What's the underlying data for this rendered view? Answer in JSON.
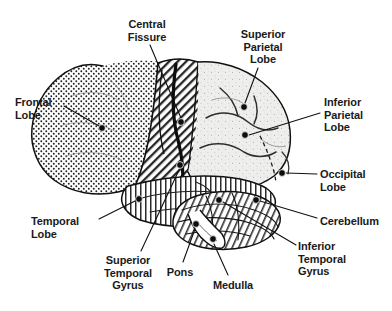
{
  "figure": {
    "background_color": "#ffffff",
    "ink_color": "#1a1a1a",
    "width": 392,
    "height": 311
  },
  "labels": [
    {
      "id": "central-fissure",
      "lines": [
        "Central",
        "Fissure"
      ],
      "align": "center",
      "x": 147,
      "y": 18,
      "marker": {
        "x": 181,
        "y": 122
      },
      "leader": [
        [
          150,
          45
        ],
        [
          181,
          118
        ]
      ]
    },
    {
      "id": "superior-parietal-lobe",
      "lines": [
        "Superior",
        "Parietal",
        "Lobe"
      ],
      "align": "center",
      "x": 263,
      "y": 28,
      "marker": {
        "x": 244,
        "y": 107
      },
      "leader": [
        [
          258,
          68
        ],
        [
          245,
          103
        ]
      ]
    },
    {
      "id": "frontal-lobe",
      "lines": [
        "Frontal",
        "Lobe"
      ],
      "align": "left",
      "x": 15,
      "y": 96,
      "marker": {
        "x": 102,
        "y": 128
      },
      "leader": [
        [
          64,
          106
        ],
        [
          99,
          126
        ]
      ]
    },
    {
      "id": "inferior-parietal-lobe",
      "lines": [
        "Inferior",
        "Parietal",
        "Lobe"
      ],
      "align": "left",
      "x": 324,
      "y": 96,
      "marker": {
        "x": 245,
        "y": 135
      },
      "leader": [
        [
          320,
          113
        ],
        [
          249,
          135
        ]
      ]
    },
    {
      "id": "occipital-lobe",
      "lines": [
        "Occipital",
        "Lobe"
      ],
      "align": "left",
      "x": 320,
      "y": 168,
      "marker": {
        "x": 282,
        "y": 173
      },
      "leader": [
        [
          317,
          174
        ],
        [
          286,
          173
        ]
      ]
    },
    {
      "id": "temporal-lobe",
      "lines": [
        "Temporal",
        "Lobe"
      ],
      "align": "left",
      "x": 31,
      "y": 215,
      "marker": {
        "x": 139,
        "y": 199
      },
      "leader": [
        [
          99,
          219
        ],
        [
          135,
          201
        ]
      ]
    },
    {
      "id": "cerebellum",
      "lines": [
        "Cerebellum"
      ],
      "align": "left",
      "x": 320,
      "y": 215,
      "marker": {
        "x": 256,
        "y": 200
      },
      "leader": [
        [
          317,
          218
        ],
        [
          260,
          201
        ]
      ]
    },
    {
      "id": "superior-temporal-gyrus",
      "lines": [
        "Superior",
        "Temporal",
        "Gyrus"
      ],
      "align": "center",
      "x": 128,
      "y": 254,
      "marker": {
        "x": 180,
        "y": 165
      },
      "leader": [
        [
          141,
          251
        ],
        [
          179,
          170
        ]
      ]
    },
    {
      "id": "pons",
      "lines": [
        "Pons"
      ],
      "align": "center",
      "x": 180,
      "y": 266,
      "marker": {
        "x": 196,
        "y": 224
      },
      "leader": [
        [
          183,
          262
        ],
        [
          195,
          229
        ]
      ]
    },
    {
      "id": "inferior-temporal-gyrus",
      "lines": [
        "Inferior",
        "Temporal",
        "Gyrus"
      ],
      "align": "left",
      "x": 298,
      "y": 240,
      "marker": {
        "x": 219,
        "y": 200
      },
      "leader": [
        [
          296,
          245
        ],
        [
          223,
          202
        ]
      ]
    },
    {
      "id": "medulla",
      "lines": [
        "Medulla"
      ],
      "align": "center",
      "x": 233,
      "y": 279,
      "marker": {
        "x": 213,
        "y": 239
      },
      "leader": [
        [
          228,
          275
        ],
        [
          214,
          244
        ]
      ]
    }
  ],
  "regions": [
    {
      "id": "frontal-lobe-region",
      "pattern": "stipple-dots",
      "name": "Frontal Lobe"
    },
    {
      "id": "central-fissure-region",
      "pattern": "diagonal-hatch",
      "name": "Central Fissure band"
    },
    {
      "id": "parietal-lobe-region",
      "pattern": "light-speckle",
      "name": "Parietal Lobe"
    },
    {
      "id": "occipital-lobe-region",
      "pattern": "light-speckle",
      "name": "Occipital Lobe"
    },
    {
      "id": "temporal-lobe-region",
      "pattern": "vertical-hatch",
      "name": "Temporal Lobe"
    },
    {
      "id": "cerebellum-region",
      "pattern": "curved-folia",
      "name": "Cerebellum"
    },
    {
      "id": "brainstem-region",
      "pattern": "plain",
      "name": "Brainstem (Pons & Medulla)"
    }
  ]
}
